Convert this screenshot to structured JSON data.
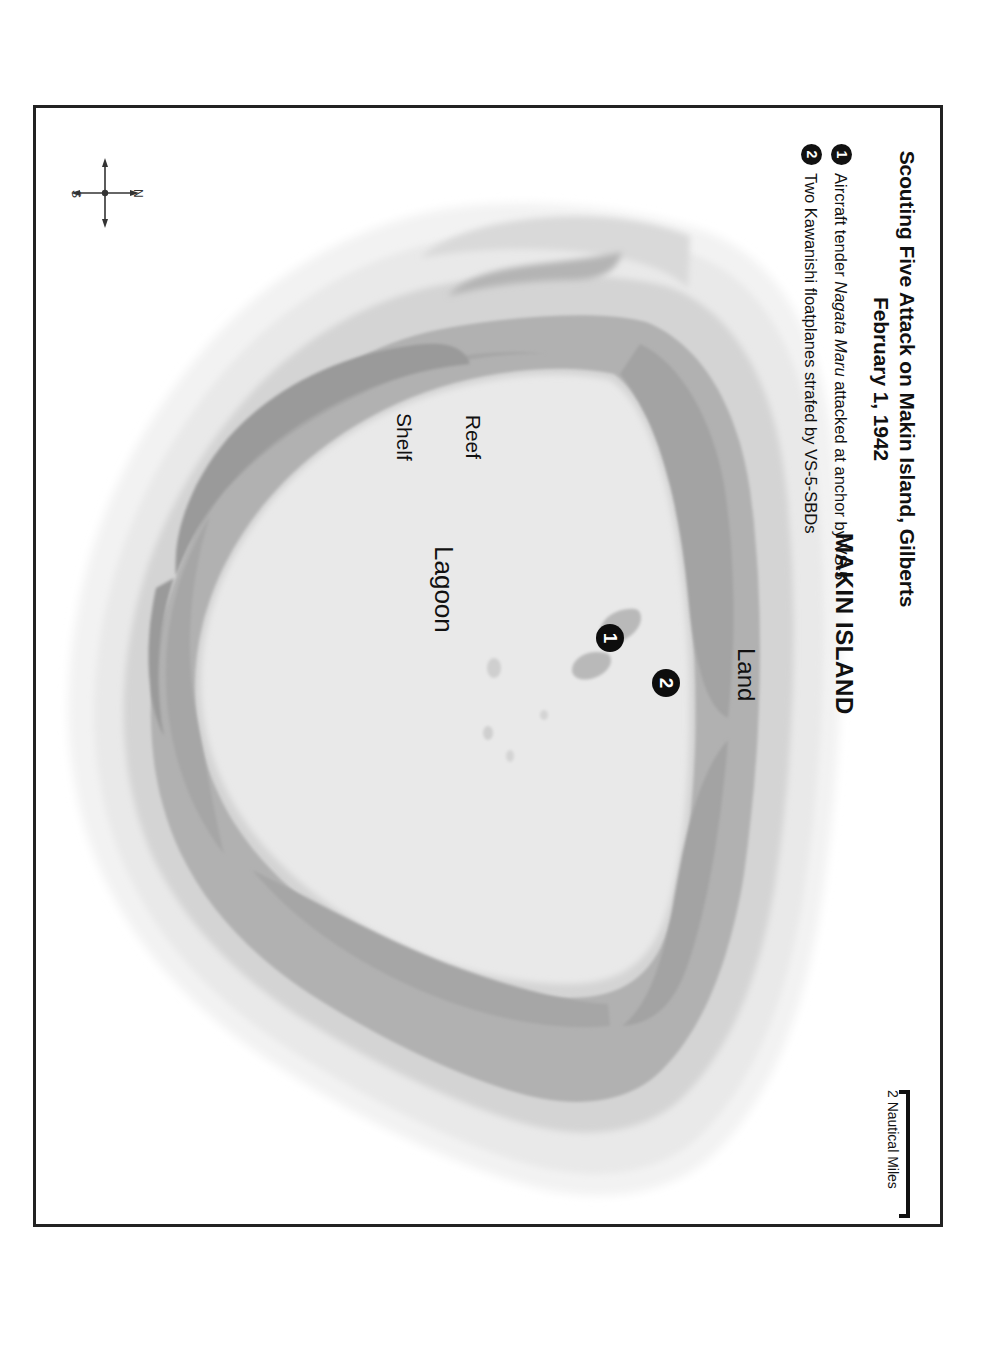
{
  "document": {
    "kind": "historical-battle-map",
    "orientation": "landscape map printed rotated on portrait page"
  },
  "title": {
    "line1": "Scouting Five Attack on Makin Island, Gilberts",
    "line2": "February 1, 1942"
  },
  "legend": {
    "items": [
      {
        "marker": "1",
        "text_before": "Aircraft tender ",
        "text_italic": "Nagata Maru",
        "text_after": " attacked at anchor by VS-5",
        "full_text": "Aircraft tender Nagata Maru attacked at anchor by VS-5"
      },
      {
        "marker": "2",
        "text_before": "Two Kawanishi floatplanes strafed by VS-5-SBDs",
        "text_italic": "",
        "text_after": "",
        "full_text": "Two Kawanishi floatplanes strafed by VS-5-SBDs"
      }
    ]
  },
  "map_labels": {
    "lagoon": "Lagoon",
    "reef_shelf_line1": "Reef",
    "reef_shelf_line2": "Shelf",
    "land": "Land",
    "island_name": "MAKIN ISLAND"
  },
  "map_markers": [
    {
      "id": "1",
      "label": "1",
      "refers_to": "Aircraft tender Nagata Maru attacked at anchor by VS-5"
    },
    {
      "id": "2",
      "label": "2",
      "refers_to": "Two Kawanishi floatplanes strafed by VS-5-SBDs"
    }
  ],
  "scale": {
    "label": "2 Nautical Miles",
    "value": 2,
    "unit": "Nautical Miles"
  },
  "compass": {
    "north": "N",
    "south": "S"
  },
  "colors": {
    "page_background": "#ffffff",
    "frame_border": "#222222",
    "text": "#111111",
    "outer_halo": "#f0f0f0",
    "shallow_water": "#e6e6e6",
    "reef_shelf": "#d2d2d2",
    "land": "#b0b0b0",
    "marker_fill": "#0d0d0d",
    "marker_text": "#ffffff"
  }
}
